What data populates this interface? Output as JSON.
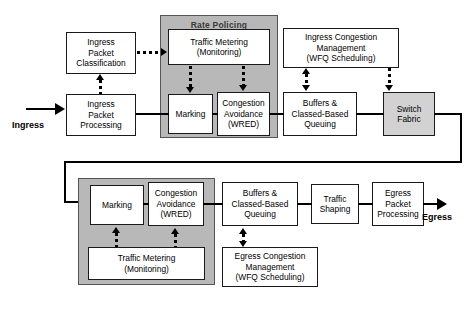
{
  "diagram": {
    "colors": {
      "group_fill": "#b8b8b8",
      "box_fill": "#ffffff",
      "shaded_box_fill": "#d2d2d2",
      "line": "#000000",
      "group_label_text": "#3a3a3a"
    },
    "groups": [
      {
        "id": "rate-policing",
        "label": "Rate Policing",
        "label_position": "top"
      },
      {
        "id": "rate-limiting",
        "label": "Rate Limiting",
        "label_position": "bottom"
      }
    ],
    "endpoints": [
      {
        "id": "ingress",
        "label": "Ingress"
      },
      {
        "id": "egress",
        "label": "Egress"
      }
    ],
    "ingress_row": {
      "classification": "Ingress\nPacket\nClassification",
      "classification_lines": [
        "Ingress",
        "Packet",
        "Classification"
      ],
      "processing_lines": [
        "Ingress",
        "Packet",
        "Processing"
      ],
      "metering_lines": [
        "Traffic Metering",
        "(Monitoring)"
      ],
      "marking_label": "Marking",
      "wred_lines": [
        "Congestion",
        "Avoidance",
        "(WRED)"
      ],
      "buffers_lines": [
        "Buffers &",
        "Classed-Based",
        "Queuing"
      ],
      "congestion_mgmt_lines": [
        "Ingress Congestion",
        "Management",
        "(WFQ Scheduling)"
      ],
      "switch_fabric_lines": [
        "Switch",
        "Fabric"
      ]
    },
    "egress_row": {
      "marking_label": "Marking",
      "wred_lines": [
        "Congestion",
        "Avoidance",
        "(WRED)"
      ],
      "metering_lines": [
        "Traffic Metering",
        "(Monitoring)"
      ],
      "buffers_lines": [
        "Buffers &",
        "Classed-Based",
        "Queuing"
      ],
      "congestion_mgmt_lines": [
        "Egress Congestion",
        "Management",
        "(WFQ Scheduling)"
      ],
      "shaping_lines": [
        "Traffic",
        "Shaping"
      ],
      "processing_lines": [
        "Egress",
        "Packet",
        "Processing"
      ]
    }
  }
}
